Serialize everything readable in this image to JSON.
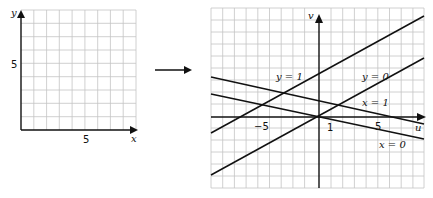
{
  "left_plot": {
    "x_axis_label": "x",
    "y_axis_label": "y",
    "x_tick_label": "5",
    "y_tick_label": "5",
    "grid": {
      "cols": 9,
      "rows": 9
    }
  },
  "mapping_arrow": {
    "icon": "right-arrow-icon"
  },
  "right_plot": {
    "u_axis_label": "u",
    "v_axis_label": "v",
    "u_tick_labels": [
      "−5",
      "1",
      "5"
    ],
    "lines": [
      {
        "label": "y = 1"
      },
      {
        "label": "y = 0"
      },
      {
        "label": "x = 1"
      },
      {
        "label": "x = 0"
      }
    ]
  },
  "colors": {
    "grid": "#c4c4c4",
    "ink": "#111111",
    "background": "#ffffff"
  }
}
